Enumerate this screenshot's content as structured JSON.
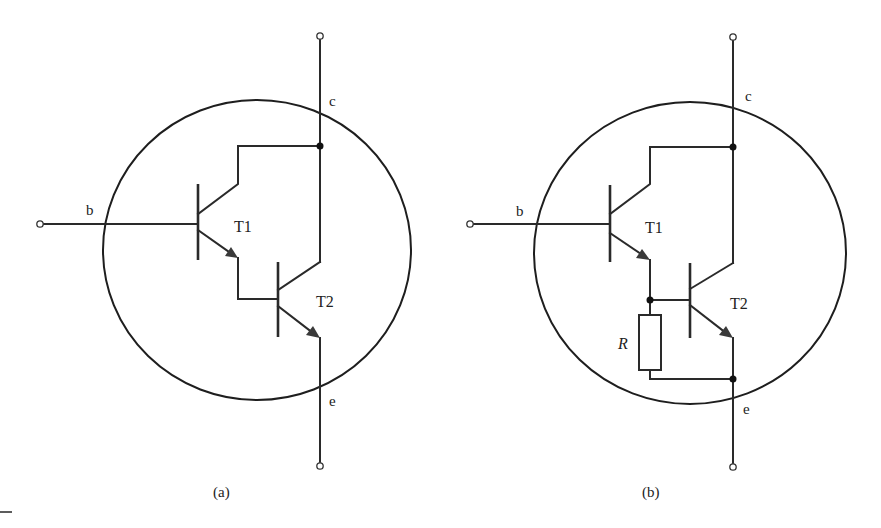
{
  "figure": {
    "panels": [
      {
        "id": "a",
        "caption": "(a)",
        "type": "Darlington transistor (two cascaded NPN transistors)",
        "terminals": {
          "collector": "c",
          "base": "b",
          "emitter": "e"
        },
        "transistors": [
          {
            "label": "T1"
          },
          {
            "label": "T2"
          }
        ]
      },
      {
        "id": "b",
        "caption": "(b)",
        "type": "Darlington transistor with bleeder resistor R between T2 base and emitter",
        "terminals": {
          "collector": "c",
          "base": "b",
          "emitter": "e"
        },
        "transistors": [
          {
            "label": "T1"
          },
          {
            "label": "T2"
          }
        ],
        "resistor": {
          "label": "R"
        }
      }
    ]
  },
  "colors": {
    "line": "#2a2a2a",
    "background": "#ffffff"
  }
}
